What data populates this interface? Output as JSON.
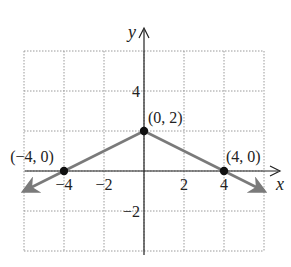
{
  "chart_data": {
    "type": "line",
    "title": "",
    "xlabel": "x",
    "ylabel": "y",
    "xlim": [
      -6,
      6
    ],
    "ylim": [
      -4,
      6
    ],
    "grid": true,
    "x_ticks": [
      {
        "value": -4,
        "label": "−4"
      },
      {
        "value": -2,
        "label": "−2"
      },
      {
        "value": 2,
        "label": "2"
      },
      {
        "value": 4,
        "label": "4"
      }
    ],
    "y_ticks": [
      {
        "value": 4,
        "label": "4"
      },
      {
        "value": -2,
        "label": "−2"
      }
    ],
    "series": [
      {
        "name": "y = 2 - |x|/2",
        "x": [
          -6,
          -4,
          0,
          4,
          6
        ],
        "y": [
          -1,
          0,
          2,
          0,
          -1
        ],
        "color": "#7a7a7a",
        "arrows_at_ends": true
      }
    ],
    "points": [
      {
        "x": -4,
        "y": 0,
        "label": "(−4, 0)"
      },
      {
        "x": 0,
        "y": 2,
        "label": "(0, 2)"
      },
      {
        "x": 4,
        "y": 0,
        "label": "(4, 0)"
      }
    ]
  },
  "colors": {
    "axis": "#222222",
    "grid": "#9a9a9a",
    "line": "#7a7a7a",
    "point": "#111111"
  }
}
